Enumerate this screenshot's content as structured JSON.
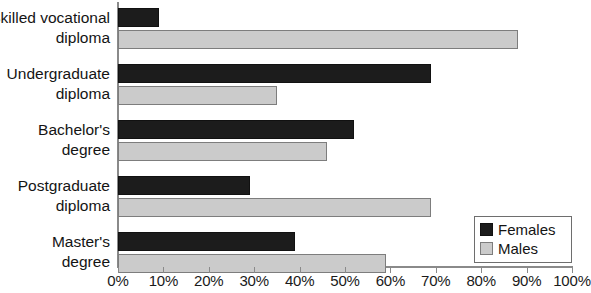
{
  "chart_data": {
    "type": "bar",
    "orientation": "horizontal",
    "title": "",
    "xlabel": "",
    "ylabel": "",
    "xlim": [
      0,
      100
    ],
    "xunit": "%",
    "grid": false,
    "legend_position": "bottom-right",
    "categories": [
      "Skilled vocational diploma",
      "Undergraduate diploma",
      "Bachelor's degree",
      "Postgraduate diploma",
      "Master's degree"
    ],
    "category_lines": [
      [
        "Skilled vocational",
        "diploma"
      ],
      [
        "Undergraduate",
        "diploma"
      ],
      [
        "Bachelor's",
        "degree"
      ],
      [
        "Postgraduate",
        "diploma"
      ],
      [
        "Master's",
        "degree"
      ]
    ],
    "series": [
      {
        "name": "Females",
        "color": "#1c1c1c",
        "values": [
          9,
          69,
          52,
          29,
          39
        ]
      },
      {
        "name": "Males",
        "color": "#cbcbcb",
        "values": [
          88,
          35,
          46,
          69,
          59
        ]
      }
    ],
    "xticks": [
      0,
      10,
      20,
      30,
      40,
      50,
      60,
      70,
      80,
      90,
      100
    ],
    "xtick_labels": [
      "0%",
      "10%",
      "20%",
      "30%",
      "40%",
      "50%",
      "60%",
      "70%",
      "80%",
      "90%",
      "100%"
    ]
  },
  "legend": {
    "items": [
      {
        "label": "Females",
        "swatch": "black-square-swatch"
      },
      {
        "label": "Males",
        "swatch": "gray-square-swatch"
      }
    ]
  }
}
